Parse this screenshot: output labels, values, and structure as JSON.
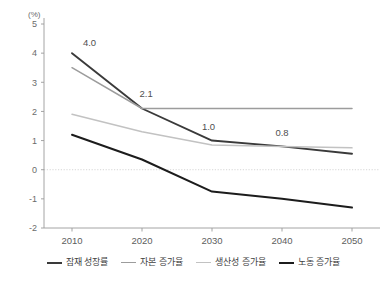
{
  "chart_data": {
    "type": "line",
    "title": "",
    "subtitle": "",
    "unit_label": "(%)",
    "xlabel": "",
    "ylabel": "",
    "x": [
      2010,
      2020,
      2030,
      2040,
      2050
    ],
    "categories": [
      "2010",
      "2020",
      "2030",
      "2040",
      "2050"
    ],
    "xlim": [
      2006,
      2054
    ],
    "ylim": [
      -2,
      5
    ],
    "yticks": [
      -2,
      -1,
      0,
      1,
      2,
      3,
      4,
      5
    ],
    "ytick_labels": [
      "-2",
      "-1",
      "0",
      "1",
      "2",
      "3",
      "4",
      "5"
    ],
    "xticks": [
      2010,
      2020,
      2030,
      2040,
      2050
    ],
    "grid": false,
    "zero_line": true,
    "legend_position": "bottom",
    "series": [
      {
        "name": "잠재 성장률",
        "color": "#3a3a3a",
        "width": 1.9,
        "values": [
          4.0,
          2.1,
          1.0,
          0.8,
          0.55
        ]
      },
      {
        "name": "자본 증가율",
        "color": "#9c9c9c",
        "width": 1.5,
        "values": [
          3.5,
          2.1,
          2.1,
          2.1,
          2.1
        ]
      },
      {
        "name": "생산성 증가율",
        "color": "#c2c2c2",
        "width": 1.5,
        "values": [
          1.9,
          1.3,
          0.85,
          0.8,
          0.75
        ]
      },
      {
        "name": "노동 증가율",
        "color": "#1c1c1c",
        "width": 2.0,
        "values": [
          1.2,
          0.35,
          -0.75,
          -1.0,
          -1.3
        ]
      }
    ],
    "annotations": [
      {
        "text": "4.0",
        "x": 2012.5,
        "y": 4.25,
        "series": "잠재 성장률"
      },
      {
        "text": "2.1",
        "x": 2020.6,
        "y": 2.5,
        "series": "잠재 성장률"
      },
      {
        "text": "1.0",
        "x": 2029.5,
        "y": 1.35,
        "series": "잠재 성장률"
      },
      {
        "text": "0.8",
        "x": 2040.0,
        "y": 1.15,
        "series": "잠재 성장률"
      }
    ]
  },
  "legend": {
    "items": [
      {
        "label": "잠재 성장률",
        "color": "#3a3a3a",
        "thickness": "2.4px"
      },
      {
        "label": "자본 증가율",
        "color": "#9c9c9c",
        "thickness": "1.6px"
      },
      {
        "label": "생산성 증가율",
        "color": "#c2c2c2",
        "thickness": "1.6px"
      },
      {
        "label": "노동 증가율",
        "color": "#1c1c1c",
        "thickness": "2.4px"
      }
    ]
  }
}
